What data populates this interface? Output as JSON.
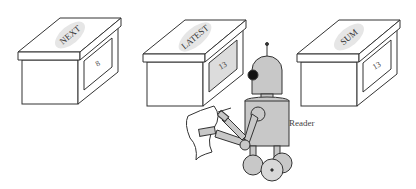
{
  "boxes": [
    {
      "name": "NEXT",
      "value": "8",
      "window_color": "#ffffff"
    },
    {
      "name": "LATEST",
      "value": "13",
      "window_color": "#dcdcdc"
    },
    {
      "name": "SUM",
      "value": "13",
      "window_color": "#ffffff"
    }
  ],
  "robot": {
    "label": "Reader",
    "body_color": "#c8c8c8",
    "eye_color": "#111111"
  },
  "colors": {
    "stroke": "#333333",
    "background": "#ffffff",
    "oval": "#dddddd"
  }
}
